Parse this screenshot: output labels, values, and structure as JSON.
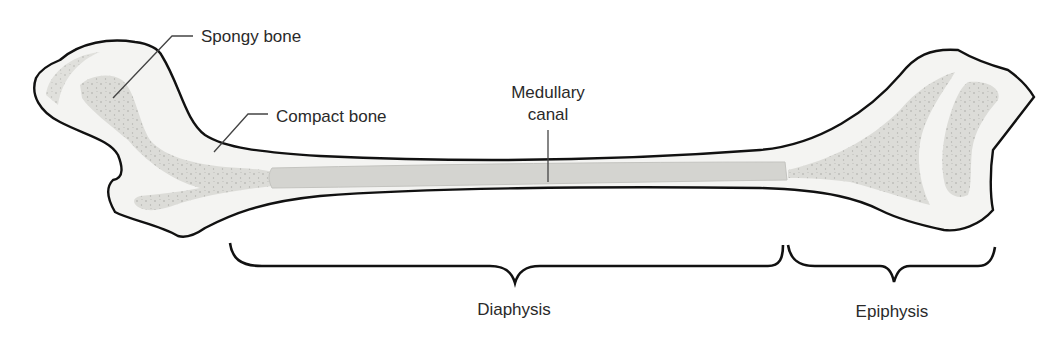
{
  "diagram": {
    "labels": {
      "spongy_bone": "Spongy bone",
      "compact_bone": "Compact bone",
      "medullary_canal_line1": "Medullary",
      "medullary_canal_line2": "canal",
      "diaphysis": "Diaphysis",
      "epiphysis": "Epiphysis"
    },
    "colors": {
      "outline": "#111111",
      "compact_fill": "#f4f4f2",
      "spongy_fill": "#dcdcd8",
      "spongy_dots": "#a8a8a4",
      "canal_fill": "#d4d4d0",
      "leader_line": "#444444",
      "text": "#2a2a2a"
    }
  }
}
